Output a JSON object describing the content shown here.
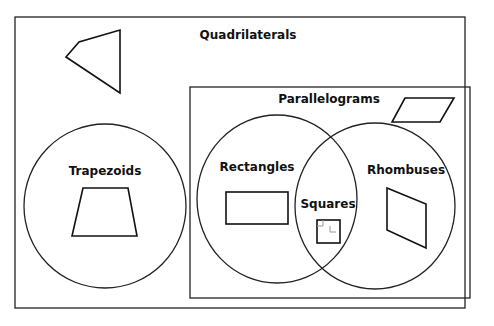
{
  "diagram": {
    "type": "venn-classification",
    "title": "Quadrilaterals",
    "colors": {
      "background": "#ffffff",
      "stroke": "#222222",
      "text": "#111111"
    },
    "sets": {
      "quadrilaterals": {
        "label": "Quadrilaterals",
        "example_shape": "irregular-quadrilateral"
      },
      "trapezoids": {
        "label": "Trapezoids",
        "example_shape": "trapezoid"
      },
      "parallelograms": {
        "label": "Parallelograms",
        "example_shape": "parallelogram"
      },
      "rectangles": {
        "label": "Rectangles",
        "example_shape": "rectangle"
      },
      "rhombuses": {
        "label": "Rhombuses",
        "example_shape": "rhombus"
      },
      "squares": {
        "label": "Squares",
        "example_shape": "square",
        "note": "intersection of Rectangles and Rhombuses"
      }
    }
  }
}
